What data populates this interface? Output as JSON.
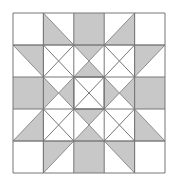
{
  "diagram": {
    "title": "",
    "type": "quilt-block",
    "grid_size": 5,
    "colors": {
      "fill": "#c8c8c8",
      "background": "#ffffff",
      "stroke": "#777777"
    },
    "shapes": {
      "gray_squares": [
        [
          2,
          0
        ],
        [
          0,
          2
        ],
        [
          4,
          2
        ],
        [
          2,
          4
        ]
      ],
      "gray_triangles": [
        [
          [
            1,
            0
          ],
          [
            1,
            1
          ],
          [
            2,
            1
          ]
        ],
        [
          [
            4,
            0
          ],
          [
            4,
            1
          ],
          [
            3,
            1
          ]
        ],
        [
          [
            0,
            1
          ],
          [
            1,
            1
          ],
          [
            1,
            2
          ]
        ],
        [
          [
            5,
            1
          ],
          [
            4,
            1
          ],
          [
            4,
            2
          ]
        ],
        [
          [
            1,
            3
          ],
          [
            1,
            4
          ],
          [
            0,
            4
          ]
        ],
        [
          [
            4,
            3
          ],
          [
            4,
            4
          ],
          [
            5,
            4
          ]
        ],
        [
          [
            1,
            4
          ],
          [
            2,
            4
          ],
          [
            1,
            5
          ]
        ],
        [
          [
            3,
            4
          ],
          [
            4,
            4
          ],
          [
            4,
            5
          ]
        ],
        [
          [
            2,
            1
          ],
          [
            3,
            1
          ],
          [
            2.5,
            1.5
          ]
        ],
        [
          [
            2,
            2
          ],
          [
            3,
            2
          ],
          [
            2.5,
            1.5
          ]
        ],
        [
          [
            2,
            4
          ],
          [
            3,
            4
          ],
          [
            2.5,
            3.5
          ]
        ],
        [
          [
            2,
            3
          ],
          [
            3,
            3
          ],
          [
            2.5,
            3.5
          ]
        ],
        [
          [
            1,
            2
          ],
          [
            1,
            3
          ],
          [
            1.5,
            2.5
          ]
        ],
        [
          [
            2,
            2
          ],
          [
            2,
            3
          ],
          [
            1.5,
            2.5
          ]
        ],
        [
          [
            4,
            2
          ],
          [
            4,
            3
          ],
          [
            3.5,
            2.5
          ]
        ],
        [
          [
            3,
            2
          ],
          [
            3,
            3
          ],
          [
            3.5,
            2.5
          ]
        ]
      ]
    }
  }
}
